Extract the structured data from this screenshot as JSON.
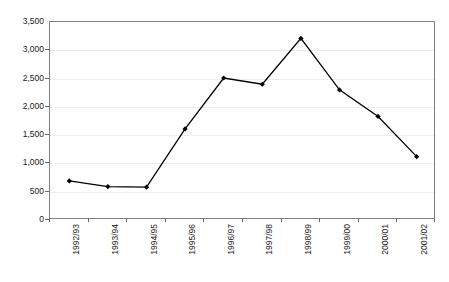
{
  "chart_data": {
    "type": "line",
    "title": "",
    "xlabel": "",
    "ylabel": "",
    "categories": [
      "1992/93",
      "1993/94",
      "1994/95",
      "1995/96",
      "1996/97",
      "1997/98",
      "1998/99",
      "1999/00",
      "2000/01",
      "2001/02"
    ],
    "values": [
      690,
      590,
      580,
      1610,
      2510,
      2400,
      3210,
      2300,
      1830,
      1120
    ],
    "series": [
      {
        "name": "",
        "values": [
          690,
          590,
          580,
          1610,
          2510,
          2400,
          3210,
          2300,
          1830,
          1120
        ]
      }
    ],
    "ylim": [
      0,
      3500
    ],
    "ytick_values": [
      0,
      500,
      1000,
      1500,
      2000,
      2500,
      3000,
      3500
    ],
    "ytick_labels": [
      "0",
      "500",
      "1,000",
      "1,500",
      "2,000",
      "2,500",
      "3,000",
      "3,500"
    ],
    "grid": true,
    "legend": false,
    "legend_position": "none",
    "line_color": "#000000",
    "marker": "diamond",
    "marker_color": "#000000",
    "gridline_color": "#ededed",
    "axis_color": "#808080",
    "background": "#ffffff"
  }
}
